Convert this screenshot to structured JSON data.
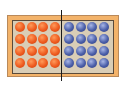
{
  "diagram": {
    "left_half": {
      "color_name": "orange",
      "color": "#ee5a1e",
      "rows": 4,
      "cols": 4,
      "count": 16
    },
    "right_half": {
      "color_name": "blue",
      "color": "#4a5ea8",
      "rows": 4,
      "cols": 4,
      "count": 16
    },
    "frame_color": "#f3b36a",
    "inner_color": "#d9cdb6",
    "divider_color": "#1a1a1a"
  }
}
